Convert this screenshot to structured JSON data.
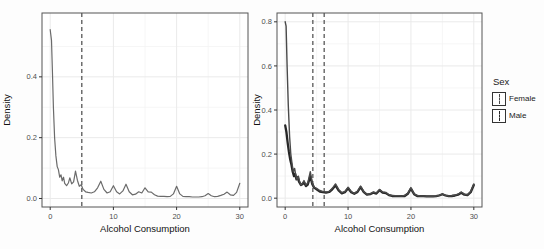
{
  "figure": {
    "background": "#fdfdfd"
  },
  "legend": {
    "title": "Sex",
    "entries": [
      {
        "label": "Female"
      },
      {
        "label": "Male"
      }
    ],
    "position": "right"
  },
  "chart_data": [
    {
      "type": "line",
      "subtype": "density",
      "title": "",
      "xlabel": "Alcohol Consumption",
      "ylabel": "Density",
      "xlim": [
        -1.3,
        31.3
      ],
      "ylim": [
        -0.028,
        0.61
      ],
      "xticks": {
        "values": [
          0,
          10,
          20,
          30
        ],
        "labels": [
          "0",
          "10",
          "20",
          "30"
        ]
      },
      "yticks": {
        "values": [
          0,
          0.2,
          0.4
        ],
        "labels": [
          "0.0",
          "0.2",
          "0.4"
        ]
      },
      "minor_x": [
        5,
        15,
        25
      ],
      "minor_y": [
        0.1,
        0.3,
        0.5
      ],
      "grid": "on",
      "panel_border": true,
      "vlines": [
        {
          "x": 5,
          "style": "dashed",
          "color": "#4a4a4a"
        }
      ],
      "colors": {
        "grid_major": "#eaeaea",
        "grid_minor": "#f4f4f4",
        "border": "#555555",
        "tick_text": "#4d4d4d",
        "title_text": "#111111"
      },
      "series": [
        {
          "name": "density",
          "color": "#6b6b6b",
          "width": 1.2,
          "points": [
            [
              0,
              0.555
            ],
            [
              0.2,
              0.52
            ],
            [
              0.35,
              0.42
            ],
            [
              0.5,
              0.3
            ],
            [
              0.7,
              0.2
            ],
            [
              0.9,
              0.14
            ],
            [
              1.1,
              0.105
            ],
            [
              1.3,
              0.095
            ],
            [
              1.5,
              0.07
            ],
            [
              1.7,
              0.078
            ],
            [
              1.9,
              0.058
            ],
            [
              2.1,
              0.07
            ],
            [
              2.3,
              0.05
            ],
            [
              2.6,
              0.042
            ],
            [
              2.9,
              0.052
            ],
            [
              3.1,
              0.068
            ],
            [
              3.4,
              0.048
            ],
            [
              3.7,
              0.055
            ],
            [
              4,
              0.09
            ],
            [
              4.3,
              0.06
            ],
            [
              4.6,
              0.04
            ],
            [
              4.9,
              0.045
            ],
            [
              5.2,
              0.03
            ],
            [
              5.6,
              0.022
            ],
            [
              6,
              0.02
            ],
            [
              6.5,
              0.018
            ],
            [
              7,
              0.022
            ],
            [
              7.5,
              0.035
            ],
            [
              8,
              0.057
            ],
            [
              8.5,
              0.03
            ],
            [
              9,
              0.018
            ],
            [
              9.5,
              0.022
            ],
            [
              10,
              0.042
            ],
            [
              10.5,
              0.022
            ],
            [
              11,
              0.015
            ],
            [
              11.5,
              0.025
            ],
            [
              12,
              0.047
            ],
            [
              12.5,
              0.022
            ],
            [
              13,
              0.012
            ],
            [
              13.5,
              0.014
            ],
            [
              14,
              0.022
            ],
            [
              14.5,
              0.018
            ],
            [
              15,
              0.035
            ],
            [
              15.5,
              0.022
            ],
            [
              16,
              0.021
            ],
            [
              16.5,
              0.012
            ],
            [
              17,
              0.008
            ],
            [
              17.5,
              0.007
            ],
            [
              18,
              0.007
            ],
            [
              18.5,
              0.006
            ],
            [
              19,
              0.007
            ],
            [
              19.5,
              0.015
            ],
            [
              20,
              0.04
            ],
            [
              20.5,
              0.015
            ],
            [
              21,
              0.007
            ],
            [
              21.5,
              0.006
            ],
            [
              22,
              0.006
            ],
            [
              22.5,
              0.005
            ],
            [
              23,
              0.005
            ],
            [
              23.5,
              0.005
            ],
            [
              24,
              0.006
            ],
            [
              24.5,
              0.009
            ],
            [
              25,
              0.016
            ],
            [
              25.5,
              0.009
            ],
            [
              26,
              0.006
            ],
            [
              26.5,
              0.007
            ],
            [
              27,
              0.01
            ],
            [
              27.5,
              0.014
            ],
            [
              28,
              0.021
            ],
            [
              28.5,
              0.012
            ],
            [
              29,
              0.01
            ],
            [
              29.5,
              0.02
            ],
            [
              30,
              0.05
            ]
          ]
        }
      ]
    },
    {
      "type": "line",
      "subtype": "density",
      "title": "",
      "xlabel": "Alcohol Consumption",
      "ylabel": "Density",
      "xlim": [
        -1.3,
        31.3
      ],
      "ylim": [
        -0.04,
        0.84
      ],
      "xticks": {
        "values": [
          0,
          10,
          20,
          30
        ],
        "labels": [
          "0",
          "10",
          "20",
          "30"
        ]
      },
      "yticks": {
        "values": [
          0,
          0.2,
          0.4,
          0.6,
          0.8
        ],
        "labels": [
          "0.0",
          "0.2",
          "0.4",
          "0.6",
          "0.8"
        ]
      },
      "minor_x": [
        5,
        15,
        25
      ],
      "minor_y": [
        0.1,
        0.3,
        0.5,
        0.7
      ],
      "grid": "on",
      "panel_border": true,
      "vlines": [
        {
          "x": 4.4,
          "style": "dashed",
          "color": "#4a4a4a"
        },
        {
          "x": 6.2,
          "style": "dashed",
          "color": "#4a4a4a"
        }
      ],
      "colors": {
        "grid_major": "#eaeaea",
        "grid_minor": "#f4f4f4",
        "border": "#555555",
        "tick_text": "#4d4d4d",
        "title_text": "#111111"
      },
      "legend_title": "Sex",
      "series": [
        {
          "name": "Male",
          "color": "#262626",
          "width": 2.3,
          "points": [
            [
              0,
              0.33
            ],
            [
              0.2,
              0.3
            ],
            [
              0.4,
              0.25
            ],
            [
              0.6,
              0.21
            ],
            [
              0.8,
              0.175
            ],
            [
              1,
              0.15
            ],
            [
              1.2,
              0.12
            ],
            [
              1.4,
              0.1
            ],
            [
              1.6,
              0.11
            ],
            [
              1.8,
              0.085
            ],
            [
              2,
              0.095
            ],
            [
              2.2,
              0.075
            ],
            [
              2.5,
              0.06
            ],
            [
              2.8,
              0.065
            ],
            [
              3,
              0.072
            ],
            [
              3.3,
              0.055
            ],
            [
              3.6,
              0.062
            ],
            [
              4,
              0.1
            ],
            [
              4.3,
              0.065
            ],
            [
              4.6,
              0.048
            ],
            [
              5,
              0.04
            ],
            [
              5.5,
              0.03
            ],
            [
              6,
              0.027
            ],
            [
              6.5,
              0.025
            ],
            [
              7,
              0.028
            ],
            [
              7.5,
              0.04
            ],
            [
              8,
              0.058
            ],
            [
              8.5,
              0.035
            ],
            [
              9,
              0.022
            ],
            [
              9.5,
              0.027
            ],
            [
              10,
              0.045
            ],
            [
              10.5,
              0.027
            ],
            [
              11,
              0.02
            ],
            [
              11.5,
              0.028
            ],
            [
              12,
              0.05
            ],
            [
              12.5,
              0.027
            ],
            [
              13,
              0.016
            ],
            [
              13.5,
              0.018
            ],
            [
              14,
              0.025
            ],
            [
              14.5,
              0.021
            ],
            [
              15,
              0.036
            ],
            [
              15.5,
              0.025
            ],
            [
              16,
              0.023
            ],
            [
              16.5,
              0.014
            ],
            [
              17,
              0.01
            ],
            [
              17.5,
              0.009
            ],
            [
              18,
              0.009
            ],
            [
              18.5,
              0.009
            ],
            [
              19,
              0.01
            ],
            [
              19.5,
              0.02
            ],
            [
              20,
              0.043
            ],
            [
              20.5,
              0.018
            ],
            [
              21,
              0.01
            ],
            [
              21.5,
              0.009
            ],
            [
              22,
              0.009
            ],
            [
              22.5,
              0.008
            ],
            [
              23,
              0.008
            ],
            [
              23.5,
              0.008
            ],
            [
              24,
              0.009
            ],
            [
              24.5,
              0.012
            ],
            [
              25,
              0.018
            ],
            [
              25.5,
              0.012
            ],
            [
              26,
              0.009
            ],
            [
              26.5,
              0.01
            ],
            [
              27,
              0.012
            ],
            [
              27.5,
              0.016
            ],
            [
              28,
              0.025
            ],
            [
              28.5,
              0.016
            ],
            [
              29,
              0.014
            ],
            [
              29.5,
              0.027
            ],
            [
              30,
              0.06
            ]
          ]
        },
        {
          "name": "Female",
          "color": "#4a4a4a",
          "width": 1.4,
          "points": [
            [
              0,
              0.8
            ],
            [
              0.15,
              0.78
            ],
            [
              0.3,
              0.6
            ],
            [
              0.5,
              0.42
            ],
            [
              0.7,
              0.28
            ],
            [
              0.9,
              0.2
            ],
            [
              1.1,
              0.155
            ],
            [
              1.3,
              0.12
            ],
            [
              1.5,
              0.135
            ],
            [
              1.7,
              0.1
            ],
            [
              1.9,
              0.085
            ],
            [
              2.1,
              0.1
            ],
            [
              2.3,
              0.075
            ],
            [
              2.5,
              0.06
            ],
            [
              2.8,
              0.07
            ],
            [
              3,
              0.08
            ],
            [
              3.3,
              0.06
            ],
            [
              3.6,
              0.07
            ],
            [
              4,
              0.12
            ],
            [
              4.3,
              0.07
            ],
            [
              4.6,
              0.05
            ],
            [
              5,
              0.045
            ],
            [
              5.5,
              0.035
            ],
            [
              6,
              0.03
            ],
            [
              6.5,
              0.028
            ],
            [
              7,
              0.03
            ],
            [
              7.5,
              0.045
            ],
            [
              8,
              0.065
            ],
            [
              8.5,
              0.04
            ],
            [
              9,
              0.025
            ],
            [
              9.5,
              0.03
            ],
            [
              10,
              0.05
            ],
            [
              10.5,
              0.03
            ],
            [
              11,
              0.022
            ],
            [
              11.5,
              0.032
            ],
            [
              12,
              0.055
            ],
            [
              12.5,
              0.03
            ],
            [
              13,
              0.018
            ],
            [
              13.5,
              0.02
            ],
            [
              14,
              0.028
            ],
            [
              14.5,
              0.024
            ],
            [
              15,
              0.04
            ],
            [
              15.5,
              0.028
            ],
            [
              16,
              0.026
            ],
            [
              16.5,
              0.016
            ],
            [
              17,
              0.012
            ],
            [
              17.5,
              0.011
            ],
            [
              18,
              0.011
            ],
            [
              18.5,
              0.01
            ],
            [
              19,
              0.012
            ],
            [
              19.5,
              0.022
            ],
            [
              20,
              0.048
            ],
            [
              20.5,
              0.02
            ],
            [
              21,
              0.012
            ],
            [
              21.5,
              0.01
            ],
            [
              22,
              0.01
            ],
            [
              22.5,
              0.009
            ],
            [
              23,
              0.009
            ],
            [
              23.5,
              0.009
            ],
            [
              24,
              0.01
            ],
            [
              24.5,
              0.013
            ],
            [
              25,
              0.02
            ],
            [
              25.5,
              0.013
            ],
            [
              26,
              0.01
            ],
            [
              26.5,
              0.011
            ],
            [
              27,
              0.014
            ],
            [
              27.5,
              0.018
            ],
            [
              28,
              0.028
            ],
            [
              28.5,
              0.018
            ],
            [
              29,
              0.016
            ],
            [
              29.5,
              0.03
            ],
            [
              30,
              0.065
            ]
          ]
        }
      ]
    }
  ]
}
